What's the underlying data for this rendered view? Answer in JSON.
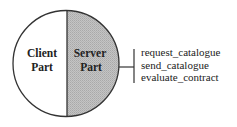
{
  "diagram": {
    "client_part": {
      "line1": "Client",
      "line2": "Part",
      "fill": "#ffffff"
    },
    "server_part": {
      "line1": "Server",
      "line2": "Part",
      "fill": "#bdbdbd"
    },
    "interface_operations": [
      "request_catalogue",
      "send_catalogue",
      "evaluate_contract"
    ],
    "stroke_color": "#333333"
  }
}
